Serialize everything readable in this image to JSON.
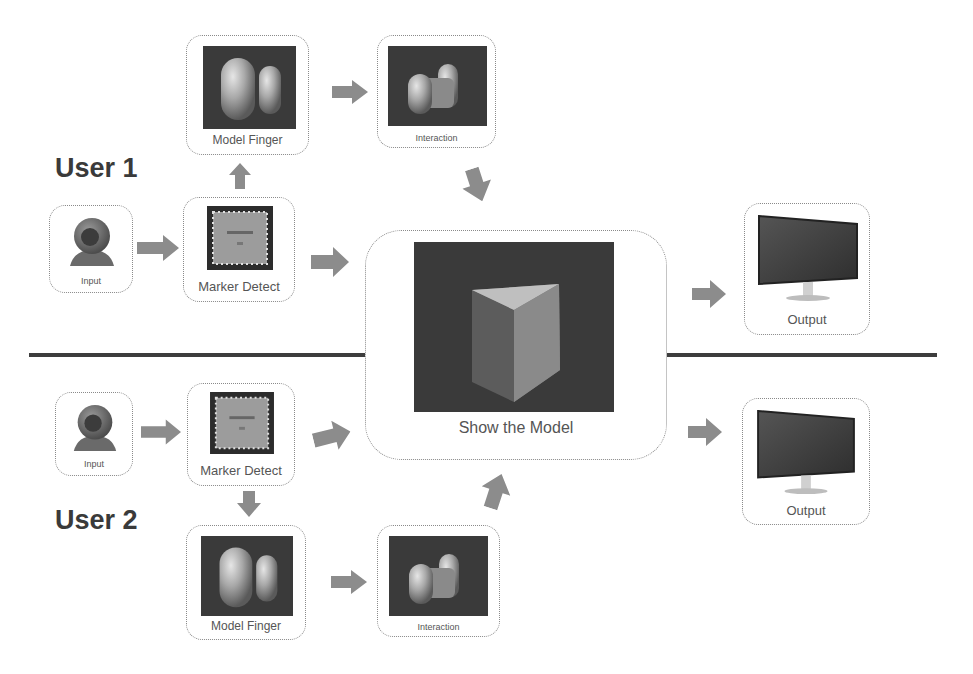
{
  "users": [
    {
      "label": "User 1"
    },
    {
      "label": "User 2"
    }
  ],
  "nodes": {
    "input_1": {
      "label": "Input",
      "icon": "webcam-icon"
    },
    "marker_detect_1": {
      "label": "Marker Detect",
      "icon": "marker-icon"
    },
    "model_finger_1": {
      "label": "Model Finger",
      "icon": "finger-model-icon"
    },
    "interaction_1": {
      "label": "Interaction",
      "icon": "interaction-icon"
    },
    "output_1": {
      "label": "Output",
      "icon": "monitor-icon"
    },
    "show_model": {
      "label": "Show the Model",
      "icon": "cube-icon"
    },
    "input_2": {
      "label": "Input",
      "icon": "webcam-icon"
    },
    "marker_detect_2": {
      "label": "Marker Detect",
      "icon": "marker-icon"
    },
    "model_finger_2": {
      "label": "Model Finger",
      "icon": "finger-model-icon"
    },
    "interaction_2": {
      "label": "Interaction",
      "icon": "interaction-icon"
    },
    "output_2": {
      "label": "Output",
      "icon": "monitor-icon"
    }
  },
  "edges": [
    [
      "input_1",
      "marker_detect_1"
    ],
    [
      "marker_detect_1",
      "model_finger_1"
    ],
    [
      "model_finger_1",
      "interaction_1"
    ],
    [
      "interaction_1",
      "show_model"
    ],
    [
      "marker_detect_1",
      "show_model"
    ],
    [
      "show_model",
      "output_1"
    ],
    [
      "input_2",
      "marker_detect_2"
    ],
    [
      "marker_detect_2",
      "model_finger_2"
    ],
    [
      "model_finger_2",
      "interaction_2"
    ],
    [
      "interaction_2",
      "show_model"
    ],
    [
      "marker_detect_2",
      "show_model"
    ],
    [
      "show_model",
      "output_2"
    ]
  ],
  "colors": {
    "arrow": "#8c8c8c",
    "divider": "#3d3d3d",
    "image_bg": "#3a3a3a",
    "border": "#8a8a8a"
  }
}
